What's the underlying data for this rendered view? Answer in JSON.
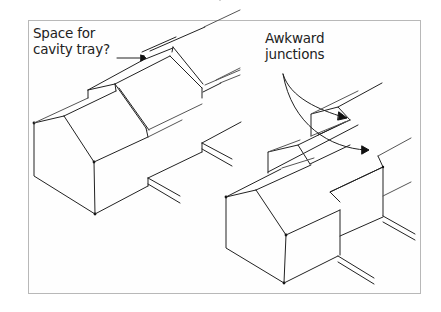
{
  "figure": {
    "annotations": [
      {
        "id": "cavity-tray",
        "lines": [
          "Space for",
          "cavity tray?"
        ],
        "points_to": "gap between stepped roof ridges on left terrace"
      },
      {
        "id": "awkward-junctions",
        "lines": [
          "Awkward",
          "junctions"
        ],
        "points_to": [
          "stepped dormer junction on right terrace",
          "stepped eaves junction on right terrace"
        ]
      }
    ],
    "drawings": [
      {
        "id": "left-terrace",
        "description": "Isometric terrace of houses stepping down, continuous roof planes with small cavity-tray gaps"
      },
      {
        "id": "right-terrace",
        "description": "Isometric terrace with staggered frontages producing awkward roof junctions"
      }
    ],
    "colors": {
      "line": "#222222",
      "frame": "#b8b8b8",
      "background": "#ffffff"
    }
  }
}
